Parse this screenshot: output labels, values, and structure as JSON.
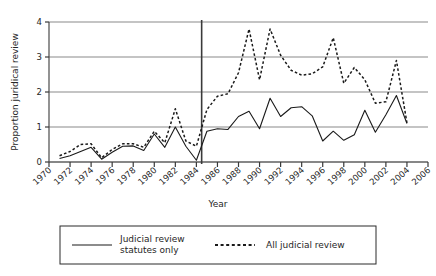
{
  "chart_data": {
    "type": "line",
    "title": "",
    "xlabel": "Year",
    "ylabel": "Proportion juridical review",
    "xlim": [
      1970,
      2006
    ],
    "ylim": [
      0,
      4
    ],
    "grid": true,
    "grid_axis": "y",
    "legend_position": "bottom",
    "x_tick_labels": [
      "1970",
      "1972",
      "1974",
      "1976",
      "1978",
      "1980",
      "1982",
      "1984",
      "1986",
      "1988",
      "1990",
      "1992",
      "1994",
      "1996",
      "1998",
      "2000",
      "2002",
      "2004",
      "2006"
    ],
    "x_tick_values": [
      1970,
      1972,
      1974,
      1976,
      1978,
      1980,
      1982,
      1984,
      1986,
      1988,
      1990,
      1992,
      1994,
      1996,
      1998,
      2000,
      2002,
      2004,
      2006
    ],
    "y_tick_labels": [
      "0",
      "1",
      "2",
      "3",
      "4"
    ],
    "y_tick_values": [
      0,
      1,
      2,
      3,
      4
    ],
    "annotations": [
      {
        "type": "vline",
        "x": 1984.5,
        "label": ""
      }
    ],
    "x": [
      1971,
      1972,
      1973,
      1974,
      1975,
      1976,
      1977,
      1978,
      1979,
      1980,
      1981,
      1982,
      1983,
      1984,
      1985,
      1986,
      1987,
      1988,
      1989,
      1990,
      1991,
      1992,
      1993,
      1994,
      1995,
      1996,
      1997,
      1998,
      1999,
      2000,
      2001,
      2002,
      2003,
      2004
    ],
    "series": [
      {
        "name": "Judicial review statutes only",
        "style": "solid",
        "color": "#1a1a1a",
        "values": [
          0.1,
          0.18,
          0.3,
          0.42,
          0.08,
          0.28,
          0.45,
          0.46,
          0.33,
          0.8,
          0.42,
          1.0,
          0.45,
          0.05,
          0.88,
          0.95,
          0.93,
          1.3,
          1.45,
          0.95,
          1.82,
          1.3,
          1.55,
          1.58,
          1.32,
          0.6,
          0.88,
          0.62,
          0.78,
          1.48,
          0.85,
          1.35,
          1.9,
          1.1
        ]
      },
      {
        "name": "All judicial review",
        "style": "dashed",
        "color": "#1a1a1a",
        "values": [
          0.18,
          0.3,
          0.5,
          0.52,
          0.12,
          0.36,
          0.52,
          0.52,
          0.42,
          0.88,
          0.55,
          1.52,
          0.6,
          0.45,
          1.5,
          1.88,
          1.95,
          2.55,
          3.8,
          2.35,
          3.8,
          3.05,
          2.62,
          2.48,
          2.52,
          2.72,
          3.55,
          2.25,
          2.7,
          2.35,
          1.68,
          1.72,
          2.9,
          1.12
        ]
      }
    ]
  },
  "legend": {
    "entries": [
      {
        "label_line1": "Judicial review",
        "label_line2": "statutes only",
        "style": "solid"
      },
      {
        "label_line1": "All judicial review",
        "label_line2": "",
        "style": "dashed"
      }
    ]
  }
}
